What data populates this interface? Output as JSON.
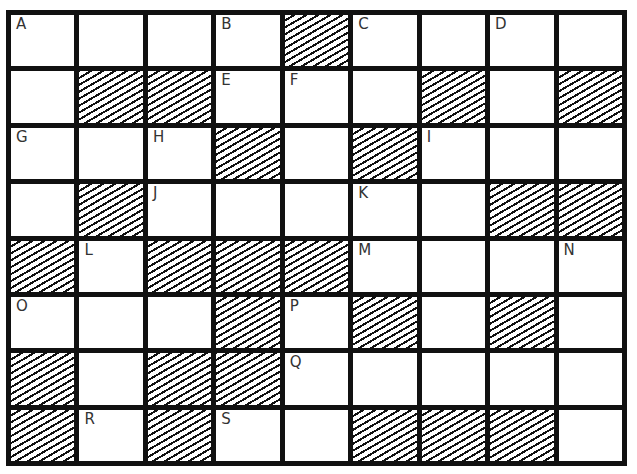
{
  "puzzle": {
    "rows": 8,
    "cols": 9,
    "grid": [
      [
        {
          "l": "A"
        },
        {},
        {},
        {
          "l": "B"
        },
        {
          "s": 1
        },
        {
          "l": "C"
        },
        {},
        {
          "l": "D"
        },
        {}
      ],
      [
        {},
        {
          "s": 1
        },
        {
          "s": 1
        },
        {
          "l": "E"
        },
        {
          "l": "F"
        },
        {},
        {
          "s": 1
        },
        {},
        {
          "s": 1
        }
      ],
      [
        {
          "l": "G"
        },
        {},
        {
          "l": "H"
        },
        {
          "s": 1
        },
        {},
        {
          "s": 1
        },
        {
          "l": "I"
        },
        {},
        {}
      ],
      [
        {},
        {
          "s": 1
        },
        {
          "l": "J"
        },
        {},
        {},
        {
          "l": "K"
        },
        {},
        {
          "s": 1
        },
        {
          "s": 1
        }
      ],
      [
        {
          "s": 1
        },
        {
          "l": "L"
        },
        {
          "s": 1
        },
        {
          "s": 1
        },
        {
          "s": 1
        },
        {
          "l": "M"
        },
        {},
        {},
        {
          "l": "N"
        }
      ],
      [
        {
          "l": "O"
        },
        {},
        {},
        {
          "s": 1
        },
        {
          "l": "P"
        },
        {
          "s": 1
        },
        {},
        {
          "s": 1
        },
        {}
      ],
      [
        {
          "s": 1
        },
        {},
        {
          "s": 1
        },
        {
          "s": 1
        },
        {
          "l": "Q"
        },
        {},
        {},
        {},
        {}
      ],
      [
        {
          "s": 1
        },
        {
          "l": "R"
        },
        {
          "s": 1
        },
        {
          "l": "S"
        },
        {},
        {
          "s": 1
        },
        {
          "s": 1
        },
        {
          "s": 1
        },
        {}
      ]
    ]
  }
}
